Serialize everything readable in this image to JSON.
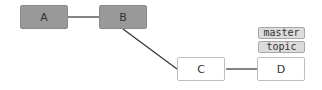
{
  "diagram": {
    "type": "commit-graph",
    "nodes": [
      {
        "id": "A",
        "label": "A",
        "style": "filled"
      },
      {
        "id": "B",
        "label": "B",
        "style": "filled"
      },
      {
        "id": "C",
        "label": "C",
        "style": "empty"
      },
      {
        "id": "D",
        "label": "D",
        "style": "empty"
      }
    ],
    "edges": [
      {
        "from": "A",
        "to": "B"
      },
      {
        "from": "B",
        "to": "C"
      },
      {
        "from": "C",
        "to": "D"
      }
    ],
    "labels": {
      "D": [
        "master",
        "topic"
      ]
    },
    "colors": {
      "filled_node": "#999999",
      "empty_node": "#ffffff",
      "tag_fill": "#dcdcdc",
      "edge": "#333333"
    }
  }
}
